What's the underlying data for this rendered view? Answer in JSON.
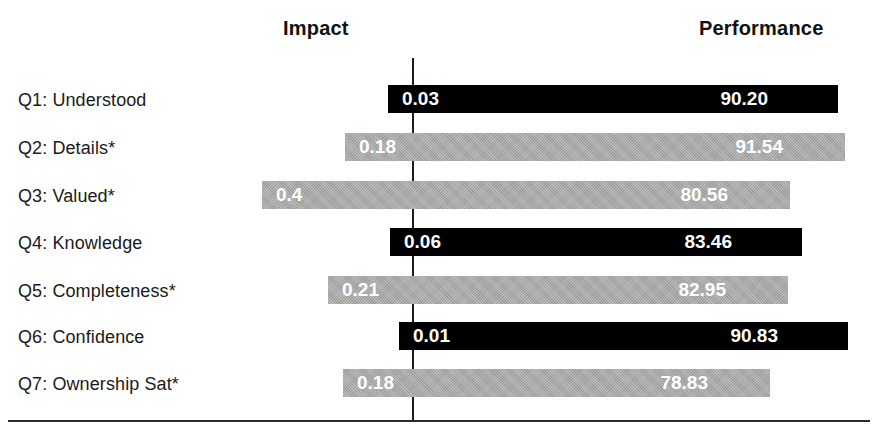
{
  "headers": {
    "impact": "Impact",
    "performance": "Performance"
  },
  "chart_data": {
    "type": "bar",
    "title": "",
    "subtitle": "",
    "xlabel": "",
    "ylabel": "",
    "orientation": "horizontal",
    "grid": false,
    "legend": "none",
    "columns": [
      "Impact",
      "Performance"
    ],
    "categories": [
      "Q1: Understood",
      "Q2: Details*",
      "Q3: Valued*",
      "Q4: Knowledge",
      "Q5: Completeness*",
      "Q6: Confidence",
      "Q7: Ownership Sat*"
    ],
    "series": [
      {
        "name": "Impact",
        "values": [
          0.03,
          0.18,
          0.4,
          0.06,
          0.21,
          0.01,
          0.18
        ],
        "labels": [
          "0.03",
          "0.18",
          "0.4",
          "0.06",
          "0.21",
          "0.01",
          "0.18"
        ]
      },
      {
        "name": "Performance",
        "values": [
          90.2,
          91.54,
          80.56,
          83.46,
          82.95,
          90.83,
          78.83
        ],
        "labels": [
          "90.20",
          "91.54",
          "80.56",
          "83.46",
          "82.95",
          "90.83",
          "78.83"
        ]
      }
    ],
    "colors": {
      "dark_bar": "#000000",
      "light_bar": "#a8a8a8",
      "value_text": "#ffffff",
      "axis_line": "#1c1c1c",
      "background": "#ffffff"
    }
  },
  "rows": [
    {
      "label": "Q1: Understood",
      "impact": "0.03",
      "performance": "90.20",
      "shade": "dark",
      "top": 85,
      "left": 388,
      "width": 450
    },
    {
      "label": "Q2: Details*",
      "impact": "0.18",
      "performance": "91.54",
      "shade": "light",
      "top": 133,
      "left": 345,
      "width": 500
    },
    {
      "label": "Q3: Valued*",
      "impact": "0.4",
      "performance": "80.56",
      "shade": "light",
      "top": 181,
      "left": 262,
      "width": 528
    },
    {
      "label": "Q4: Knowledge",
      "impact": "0.06",
      "performance": "83.46",
      "shade": "dark",
      "top": 228,
      "left": 390,
      "width": 412
    },
    {
      "label": "Q5: Completeness*",
      "impact": "0.21",
      "performance": "82.95",
      "shade": "light",
      "top": 276,
      "left": 328,
      "width": 460
    },
    {
      "label": "Q6: Confidence",
      "impact": "0.01",
      "performance": "90.83",
      "shade": "dark",
      "top": 322,
      "left": 399,
      "width": 449
    },
    {
      "label": "Q7: Ownership Sat*",
      "impact": "0.18",
      "performance": "78.83",
      "shade": "light",
      "top": 369,
      "left": 343,
      "width": 427
    }
  ],
  "axis": {
    "zero_line_label": "0"
  },
  "footnote": ""
}
